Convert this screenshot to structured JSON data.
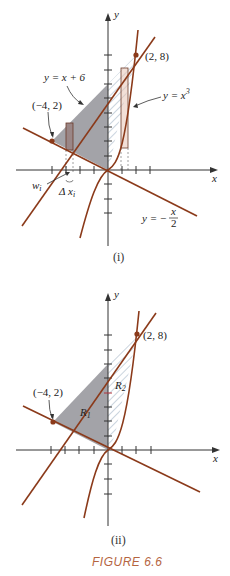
{
  "figure": {
    "caption": "FIGURE 6.6",
    "panels": [
      {
        "id": "i",
        "label": "(i)",
        "axis_x": "x",
        "axis_y": "y",
        "curve_labels": {
          "line_upper": "y = x + 6",
          "cubic": "y = x",
          "cubic_exp": "3",
          "line_lower": "y = −",
          "line_lower_num": "x",
          "line_lower_den": "2"
        },
        "points": [
          {
            "label": "(−4, 2)",
            "x": -4,
            "y": 2
          },
          {
            "label": "(2, 8)",
            "x": 2,
            "y": 8
          }
        ],
        "annotations": {
          "w": "w",
          "w_sub": "i",
          "dx": "Δ x",
          "dx_sub": "i"
        }
      },
      {
        "id": "ii",
        "label": "(ii)",
        "axis_x": "x",
        "axis_y": "y",
        "points": [
          {
            "label": "(−4, 2)",
            "x": -4,
            "y": 2
          },
          {
            "label": "(2, 8)",
            "x": 2,
            "y": 8
          }
        ],
        "regions": [
          {
            "label": "R",
            "sub": "1"
          },
          {
            "label": "R",
            "sub": "2"
          }
        ]
      }
    ],
    "colors": {
      "curve": "#8b3a1a",
      "shade": "#a3a3a8",
      "hatch": "#8aa0b8",
      "rect_fill": "#c9a9a6",
      "caption": "#b5653f"
    }
  }
}
